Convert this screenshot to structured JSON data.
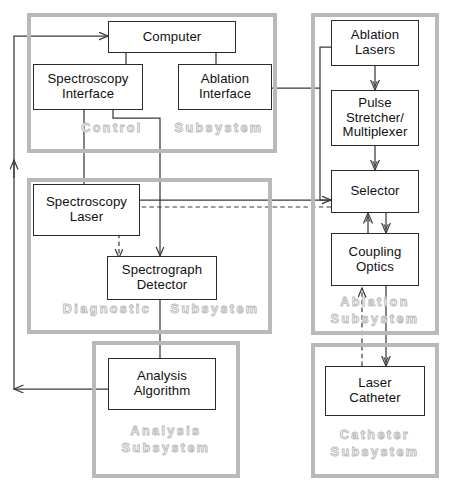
{
  "diagram": {
    "colors": {
      "box_border": "#2b2b2b",
      "subsystem_border": "#b9b9b9",
      "subsystem_label": "#bdbdbd",
      "wire": "#3a3a3a",
      "background": "#ffffff"
    },
    "subsystems": [
      {
        "id": "control",
        "label": "Control  Subsystem",
        "label_line1": "Control",
        "label_line2": "Subsystem"
      },
      {
        "id": "diagnostic",
        "label": "Diagnostic  Subsystem",
        "label_line1": "Diagnostic",
        "label_line2": "Subsystem"
      },
      {
        "id": "analysis",
        "label": "Analysis\nSubsystem",
        "label_line1": "Analysis",
        "label_line2": "Subsystem"
      },
      {
        "id": "ablation",
        "label": "Ablation\nSubsystem",
        "label_line1": "Ablation",
        "label_line2": "Subsystem"
      },
      {
        "id": "catheter",
        "label": "Catheter\nSubsystem",
        "label_line1": "Catheter",
        "label_line2": "Subsystem"
      }
    ],
    "nodes": [
      {
        "id": "computer",
        "label": "Computer",
        "subsystem": "control"
      },
      {
        "id": "spectroscopy-interface",
        "label": "Spectroscopy\nInterface",
        "subsystem": "control"
      },
      {
        "id": "ablation-interface",
        "label": "Ablation\nInterface",
        "subsystem": "control"
      },
      {
        "id": "spectroscopy-laser",
        "label": "Spectroscopy\nLaser",
        "subsystem": "diagnostic"
      },
      {
        "id": "spectrograph-detector",
        "label": "Spectrograph\nDetector",
        "subsystem": "diagnostic"
      },
      {
        "id": "analysis-algorithm",
        "label": "Analysis\nAlgorithm",
        "subsystem": "analysis"
      },
      {
        "id": "ablation-lasers",
        "label": "Ablation\nLasers",
        "subsystem": "ablation"
      },
      {
        "id": "pulse-stretcher",
        "label": "Pulse\nStretcher/\nMultiplexer",
        "subsystem": "ablation"
      },
      {
        "id": "selector",
        "label": "Selector",
        "subsystem": "ablation"
      },
      {
        "id": "coupling-optics",
        "label": "Coupling\nOptics",
        "subsystem": "ablation"
      },
      {
        "id": "laser-catheter",
        "label": "Laser\nCatheter",
        "subsystem": "catheter"
      }
    ],
    "connections": [
      {
        "from": "analysis-algorithm",
        "to": "computer",
        "style": "solid",
        "kind": "electrical"
      },
      {
        "from": "computer",
        "to": "spectroscopy-interface",
        "style": "solid",
        "kind": "electrical"
      },
      {
        "from": "computer",
        "to": "ablation-interface",
        "style": "solid",
        "kind": "electrical"
      },
      {
        "from": "spectroscopy-interface",
        "to": "spectroscopy-laser",
        "style": "solid",
        "kind": "electrical"
      },
      {
        "from": "spectroscopy-interface",
        "to": "spectrograph-detector",
        "style": "solid",
        "kind": "electrical"
      },
      {
        "from": "ablation-interface",
        "to": "ablation-lasers",
        "style": "solid",
        "kind": "electrical"
      },
      {
        "from": "ablation-interface",
        "to": "selector",
        "style": "solid",
        "kind": "electrical"
      },
      {
        "from": "spectroscopy-laser",
        "to": "selector",
        "style": "solid",
        "kind": "optical"
      },
      {
        "from": "selector",
        "to": "spectrograph-detector",
        "style": "dashed",
        "kind": "optical-return"
      },
      {
        "from": "spectrograph-detector",
        "to": "analysis-algorithm",
        "style": "solid",
        "kind": "electrical"
      },
      {
        "from": "ablation-lasers",
        "to": "pulse-stretcher",
        "style": "double",
        "kind": "optical"
      },
      {
        "from": "pulse-stretcher",
        "to": "selector",
        "style": "double",
        "kind": "optical"
      },
      {
        "from": "selector",
        "to": "coupling-optics",
        "style": "double",
        "kind": "optical"
      },
      {
        "from": "coupling-optics",
        "to": "selector",
        "style": "double",
        "kind": "optical"
      },
      {
        "from": "coupling-optics",
        "to": "laser-catheter",
        "style": "double",
        "kind": "optical"
      },
      {
        "from": "laser-catheter",
        "to": "coupling-optics",
        "style": "dashed",
        "kind": "optical-return"
      }
    ]
  }
}
